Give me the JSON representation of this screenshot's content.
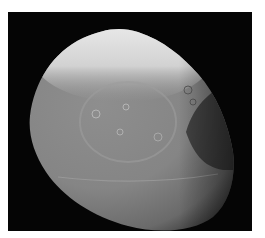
{
  "image": {
    "subject": "Saturn's moon Iapetus",
    "description": "Grayscale photograph of a cratered moon on a black background; bright, heavily cratered cap at top, large circular basin in middle, dark shadowed terminator on right side",
    "colors": {
      "background": "#ffffff",
      "space": "#050505",
      "surface_mid": "#8a8a8a",
      "surface_bright": "#e8e8e8",
      "surface_dark": "#3a3a3a"
    }
  }
}
